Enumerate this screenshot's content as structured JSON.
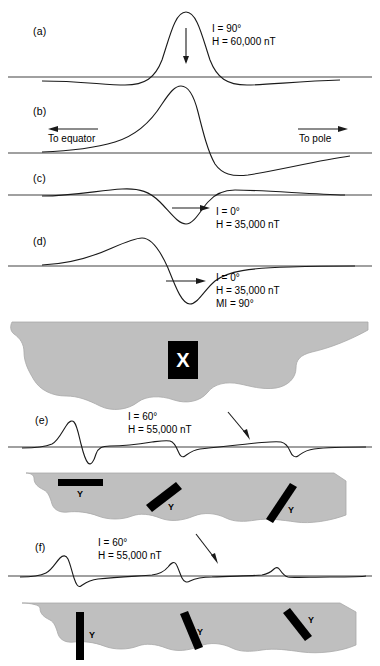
{
  "figure": {
    "colors": {
      "body_fill": "#bfbfbf",
      "body_stroke": "#9a9a9a",
      "curve": "#1a1a1a",
      "baseline": "#808080",
      "dike": "#000000",
      "background": "#ffffff"
    }
  },
  "panels": [
    {
      "id": "a",
      "label": "(a)",
      "annotation": [
        "I = 90°",
        "H = 60,000 nT"
      ],
      "arrow": "down",
      "description": "symmetric positive peak with small negative side lobes"
    },
    {
      "id": "b",
      "label": "(b)",
      "annotation": [],
      "arrow": "none",
      "description": "asymmetric dipolar anomaly, positive lobe left of negative lobe"
    },
    {
      "id": "c",
      "label": "(c)",
      "annotation": [
        "I = 0°",
        "H = 35,000 nT"
      ],
      "arrow": "right",
      "description": "central negative trough with positive shoulders"
    },
    {
      "id": "d",
      "label": "(d)",
      "annotation": [
        "I = 0°",
        "H = 35,000 nT",
        "MI = 90°"
      ],
      "arrow": "right",
      "description": "positive rise then deep negative trough"
    },
    {
      "id": "e",
      "label": "(e)",
      "annotation": [
        "I = 60°",
        "H = 55,000 nT"
      ],
      "arrow": "diagonal-down-right",
      "description": "three dipolar anomalies of decreasing amplitude over dikes"
    },
    {
      "id": "f",
      "label": "(f)",
      "annotation": [
        "I = 60°",
        "H = 55,000 nT"
      ],
      "arrow": "diagonal-down-right",
      "description": "three positive anomalies of decreasing amplitude over dikes"
    }
  ],
  "direction_labels": {
    "left": "To equator",
    "right": "To pole"
  },
  "body_markers": {
    "x": "X",
    "y": "Y"
  },
  "geology": [
    {
      "id": "body-x",
      "marker": "X",
      "dikes": [
        {
          "label": "X",
          "orientation": "block"
        }
      ]
    },
    {
      "id": "body-y-middle",
      "marker": "Y",
      "dikes": [
        {
          "label": "Y",
          "orientation": "horizontal"
        },
        {
          "label": "Y",
          "orientation": "tilted-right"
        },
        {
          "label": "Y",
          "orientation": "tilted-right"
        }
      ]
    },
    {
      "id": "body-y-bottom",
      "marker": "Y",
      "dikes": [
        {
          "label": "Y",
          "orientation": "vertical"
        },
        {
          "label": "Y",
          "orientation": "tilted-left"
        },
        {
          "label": "Y",
          "orientation": "tilted-left"
        }
      ]
    }
  ]
}
